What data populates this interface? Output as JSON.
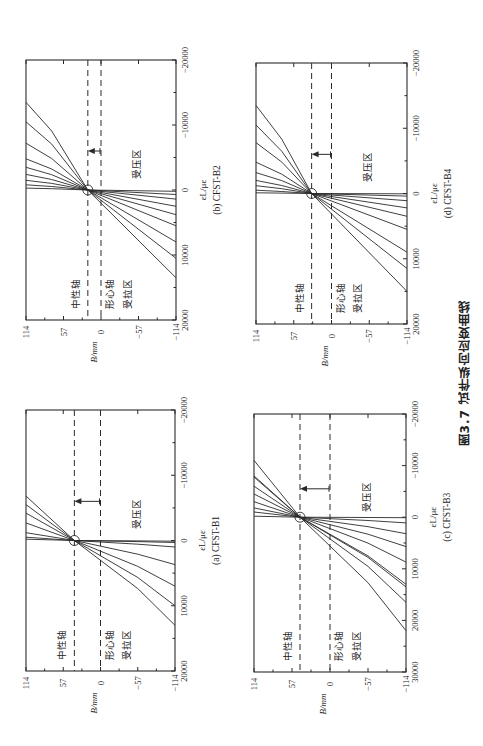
{
  "figure": {
    "caption": "图3.7  试件纵向应变曲线",
    "orientation": "rotated 90° counter-clockwise"
  },
  "chart_data": [
    {
      "id": "b",
      "type": "line",
      "title": "(b) CFST-B2",
      "xlabel": "εL/με",
      "ylabel": "B/mm",
      "xlim": [
        20000,
        -20000
      ],
      "ylim": [
        -114,
        114
      ],
      "xticks": [
        20000,
        10000,
        0,
        -10000,
        -20000
      ],
      "yticks": [
        114,
        57,
        0,
        -57,
        -114
      ],
      "annotations": [
        "中性轴",
        "形心轴",
        "受拉区",
        "受压区"
      ],
      "neutral_axis_B": 20,
      "centroid_axis_B": 0,
      "series_top_bottom": [
        [
          -13500,
          13500
        ],
        [
          -10500,
          10500
        ],
        [
          -7200,
          8000
        ],
        [
          -4800,
          5500
        ],
        [
          -3500,
          3800
        ],
        [
          -2400,
          2500
        ],
        [
          -1500,
          1400
        ],
        [
          -800,
          700
        ],
        [
          -300,
          200
        ]
      ],
      "bend_B": 75,
      "box": {
        "left": 26,
        "top": 60,
        "right": 176,
        "bottom": 320
      }
    },
    {
      "id": "d",
      "type": "line",
      "title": "(d) CFST-B4",
      "xlabel": "εL/με",
      "ylabel": "B/mm",
      "xlim": [
        20000,
        -20000
      ],
      "ylim": [
        -114,
        114
      ],
      "xticks": [
        20000,
        10000,
        0,
        -10000,
        -20000
      ],
      "yticks": [
        114,
        57,
        0,
        -57,
        -114
      ],
      "annotations": [
        "中性轴",
        "形心轴",
        "受拉区",
        "受压区"
      ],
      "neutral_axis_B": 30,
      "centroid_axis_B": 0,
      "series_top_bottom": [
        [
          -13500,
          15000
        ],
        [
          -10500,
          11500
        ],
        [
          -7800,
          9000
        ],
        [
          -4800,
          5500
        ],
        [
          -3200,
          3500
        ],
        [
          -2000,
          2200
        ],
        [
          -1200,
          1100
        ],
        [
          -500,
          400
        ],
        [
          -100,
          50
        ]
      ],
      "bend_B": 75,
      "box": {
        "left": 256,
        "top": 63,
        "right": 407,
        "bottom": 324
      }
    },
    {
      "id": "a",
      "type": "line",
      "title": "(a) CFST-B1",
      "xlabel": "εL/με",
      "ylabel": "B/mm",
      "xlim": [
        20000,
        -20000
      ],
      "ylim": [
        -114,
        114
      ],
      "xticks": [
        20000,
        10000,
        0,
        -10000,
        -20000
      ],
      "yticks": [
        114,
        57,
        0,
        -57,
        -114
      ],
      "annotations": [
        "中性轴",
        "形心轴",
        "受拉区",
        "受压区"
      ],
      "neutral_axis_B": 40,
      "centroid_axis_B": 0,
      "series_top_bottom": [
        [
          -6800,
          13000
        ],
        [
          -5500,
          10000
        ],
        [
          -4200,
          7000
        ],
        [
          -2700,
          3700
        ],
        [
          -1200,
          1000
        ],
        [
          -500,
          300
        ],
        [
          -200,
          100
        ]
      ],
      "bend_B": -57,
      "box": {
        "left": 26,
        "top": 410,
        "right": 175,
        "bottom": 671
      }
    },
    {
      "id": "c",
      "type": "line",
      "title": "(c) CFST-B3",
      "xlabel": "εL/με",
      "ylabel": "B/mm",
      "xlim": [
        30000,
        -20000
      ],
      "ylim": [
        -114,
        114
      ],
      "xticks": [
        30000,
        20000,
        10000,
        0,
        -10000,
        -20000
      ],
      "yticks": [
        114,
        57,
        0,
        -57,
        -114
      ],
      "annotations": [
        "中性轴",
        "形心轴",
        "受拉区",
        "受压区"
      ],
      "neutral_axis_B": 45,
      "centroid_axis_B": 0,
      "series_top_bottom": [
        [
          -11000,
          22000
        ],
        [
          -8000,
          16500
        ],
        [
          -7800,
          13500
        ],
        [
          -6000,
          13000
        ],
        [
          -4500,
          8700
        ],
        [
          -3000,
          5700
        ],
        [
          -1800,
          3200
        ],
        [
          -1000,
          1100
        ],
        [
          -200,
          100
        ]
      ],
      "bend_B": -57,
      "box": {
        "left": 254,
        "top": 414,
        "right": 406,
        "bottom": 672
      }
    }
  ]
}
